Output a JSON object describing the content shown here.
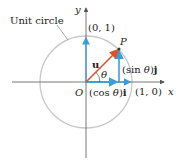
{
  "labels": {
    "unit_circle": "Unit circle",
    "y_axis": "y",
    "x_axis": "x",
    "top_point": "(0, 1)",
    "right_point": "(1, 0)",
    "point_p": "P",
    "origin": "O",
    "vector_u": "u",
    "angle": "θ",
    "sin_open": "(sin ",
    "sin_theta": "θ",
    "sin_close": ")",
    "sin_j": "j",
    "cos_open": "(cos ",
    "cos_theta": "θ",
    "cos_close": ")",
    "cos_i": "i"
  },
  "colors": {
    "circle": "#c8c8c8",
    "axes": "#555555",
    "unit_vector": "#d9532c",
    "components": "#3b9ed8"
  }
}
